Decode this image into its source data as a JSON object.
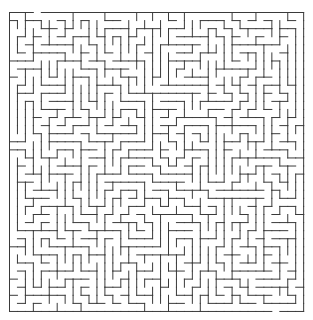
{
  "maze": {
    "cols": 37,
    "rows": 37,
    "origin_x": 9.5,
    "origin_y": 12.5,
    "cell_w": 7.95,
    "cell_h": 8.08,
    "wall_color": "#3a3a3a",
    "background_color": "#ffffff",
    "wall_width": 1,
    "entrance": {
      "side": "top",
      "col": 3
    },
    "exit": {
      "side": "bottom",
      "col": 33
    },
    "seed": 20240917
  }
}
